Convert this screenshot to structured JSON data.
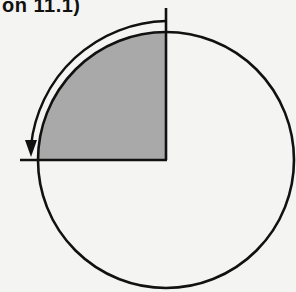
{
  "header": {
    "text": "on 11.1)"
  },
  "diagram": {
    "circle": {
      "cx": 166,
      "cy": 160,
      "r": 128,
      "stroke": "#111111"
    },
    "shaded_sector": {
      "quadrant": "upper-left",
      "fill": "#a9a9a9"
    },
    "arrow": {
      "direction": "counterclockwise",
      "r": 139,
      "icon": "curved-arrow-icon"
    },
    "colors": {
      "line": "#111111",
      "shade": "#a9a9a9",
      "background": "#f4f4f3"
    }
  }
}
